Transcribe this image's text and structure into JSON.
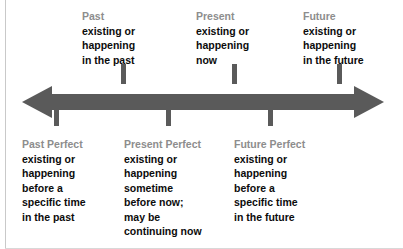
{
  "diagram": {
    "type": "timeline",
    "colors": {
      "arrow": "#5a5a5a",
      "tick": "#5a5a5a",
      "heading_text": "#8d8d8d",
      "body_text": "#0c0c0c",
      "background": "#ffffff",
      "frame": "#c9c9c9"
    },
    "axis": {
      "direction": "bidirectional",
      "left_arrowhead": "past",
      "right_arrowhead": "future"
    }
  },
  "above": [
    {
      "heading": "Past",
      "body": "existing or\nhappening\nin the past",
      "tick_x": 121
    },
    {
      "heading": "Present",
      "body": "existing or\nhappening\nnow",
      "tick_x": 232
    },
    {
      "heading": "Future",
      "body": "existing or\nhappening\nin the future",
      "tick_x": 337
    }
  ],
  "below": [
    {
      "heading": "Past Perfect",
      "body": "existing or\nhappening\nbefore a\nspecific time\nin the past",
      "tick_x": 54
    },
    {
      "heading": "Present Perfect",
      "body": "existing or\nhappening\nsometime\nbefore now;\nmay be\ncontinuing now",
      "tick_x": 166
    },
    {
      "heading": "Future Perfect",
      "body": "existing or\nhappening\nbefore a\nspecific time\nin the future",
      "tick_x": 268
    }
  ]
}
